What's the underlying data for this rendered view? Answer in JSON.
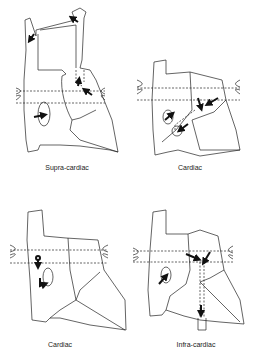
{
  "panels": [
    {
      "id": "supra-cardiac",
      "label": "Supra-cardiac"
    },
    {
      "id": "cardiac-1",
      "label": "Cardiac"
    },
    {
      "id": "cardiac-2",
      "label": "Cardiac"
    },
    {
      "id": "infra-cardiac",
      "label": "Infra-cardiac"
    }
  ]
}
